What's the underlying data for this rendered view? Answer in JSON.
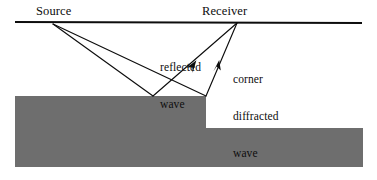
{
  "figure": {
    "kind": "seismic-ray-path-diagram",
    "width": 377,
    "height": 180,
    "background_color": "#ffffff",
    "labels": {
      "source": "Source",
      "receiver": "Receiver",
      "reflected_wave": {
        "line1": "reflected",
        "line2": "wave"
      },
      "corner_diffracted_wave": {
        "line1": "corner",
        "line2": "diffracted",
        "line3": "wave"
      }
    },
    "colors": {
      "subsurface_fill": "#6e6e6e",
      "line_stroke": "#0d0d0d",
      "text": "#0d0d0d",
      "background": "#ffffff"
    },
    "geometry": {
      "surface_line": {
        "x1": 15,
        "y1": 22,
        "x2": 362,
        "y2": 23
      },
      "source_point": {
        "x": 53,
        "y": 24
      },
      "receiver_point": {
        "x": 237,
        "y": 23
      },
      "reflection_point": {
        "x": 153,
        "y": 96
      },
      "corner_point": {
        "x": 206,
        "y": 96
      },
      "upper_block": {
        "x": 15,
        "y": 96,
        "width": 191,
        "height": 71
      },
      "lower_block": {
        "x": 206,
        "y": 128,
        "width": 157,
        "height": 39
      }
    },
    "rays": [
      {
        "name": "reflected-wave-downgoing",
        "from": "source_point",
        "to": "reflection_point",
        "arrow": false
      },
      {
        "name": "reflected-wave-upgoing",
        "from": "reflection_point",
        "to": "receiver_point",
        "arrow": true
      },
      {
        "name": "diffracted-wave-downgoing",
        "from": "source_point",
        "to": "corner_point",
        "arrow": false
      },
      {
        "name": "diffracted-wave-upgoing",
        "from": "corner_point",
        "to": "receiver_point",
        "arrow": true
      }
    ]
  }
}
